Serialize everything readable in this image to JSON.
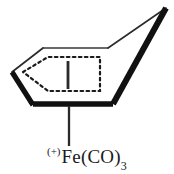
{
  "figure": {
    "kind": "chemical-structure-diagram",
    "background_color": "#ffffff",
    "line_color": "#111111"
  },
  "ring": {
    "name": "cyclohexadienyl-ring",
    "bold_edge_color": "#111111",
    "thin_edge_color": "#333333",
    "bold_edge_width": 5,
    "thin_edge_width": 1.4,
    "vertices": [
      {
        "id": "left",
        "x": 12,
        "y": 72
      },
      {
        "id": "top-left",
        "x": 43,
        "y": 48
      },
      {
        "id": "top-right",
        "x": 108,
        "y": 48
      },
      {
        "id": "apex",
        "x": 166,
        "y": 8
      },
      {
        "id": "bottom-right",
        "x": 113,
        "y": 104
      },
      {
        "id": "bottom-left",
        "x": 33,
        "y": 104
      }
    ]
  },
  "delocalization": {
    "name": "dotted-delocalization-outline",
    "style": "dotted",
    "color": "#1a1a1a",
    "dash_pattern": "2.6 3.2",
    "stroke_width": 2.1,
    "points": [
      {
        "x": 23,
        "y": 72
      },
      {
        "x": 48,
        "y": 57
      },
      {
        "x": 100,
        "y": 57
      },
      {
        "x": 100,
        "y": 91
      },
      {
        "x": 48,
        "y": 91
      }
    ]
  },
  "bonds": {
    "interior_vertical": {
      "name": "interior-vertical-bond",
      "x": 68,
      "y1": 61,
      "y2": 89,
      "width": 2.6,
      "color": "#2a2a2a"
    },
    "metal_bond": {
      "name": "ring-to-metal-bond",
      "x": 69,
      "y1": 106,
      "y2": 146,
      "width": 2.2,
      "color": "#2a2a2a"
    }
  },
  "label": {
    "name": "metal-fragment-label",
    "charge": "(+)",
    "formula_main": "Fe(CO)",
    "subscript": "3",
    "full_text": "(+)Fe(CO)3"
  }
}
